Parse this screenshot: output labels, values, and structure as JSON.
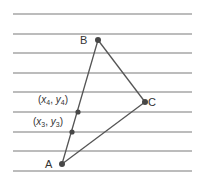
{
  "diagram": {
    "title": "",
    "colors": {
      "background": "#ffffff",
      "rule_lines": "#7a7a7a",
      "triangle": "#555555",
      "points": "#474747",
      "labels": "#333333"
    },
    "rule_lines": {
      "x_start": 13,
      "x_end": 192,
      "y_positions": [
        14,
        34,
        53,
        73,
        92,
        112,
        132,
        151,
        171
      ]
    },
    "points": [
      {
        "id": "A",
        "label": "A",
        "x": 62,
        "y": 164
      },
      {
        "id": "B",
        "label": "B",
        "x": 98,
        "y": 40
      },
      {
        "id": "C",
        "label": "C",
        "x": 145,
        "y": 102
      },
      {
        "id": "P4",
        "label": "(x4, y4)",
        "x": 78,
        "y": 112
      },
      {
        "id": "P3",
        "label": "(x3, y3)",
        "x": 72,
        "y": 132
      }
    ],
    "labels": {
      "A": "A",
      "B": "B",
      "C": "C",
      "p4_x": "x",
      "p4_xsub": "4",
      "p4_y": "y",
      "p4_ysub": "4",
      "p3_x": "x",
      "p3_xsub": "3",
      "p3_y": "y",
      "p3_ysub": "3",
      "open_paren": "(",
      "close_paren": ")",
      "comma": ", "
    },
    "edges": [
      [
        "A",
        "B"
      ],
      [
        "B",
        "C"
      ],
      [
        "C",
        "A"
      ]
    ]
  }
}
